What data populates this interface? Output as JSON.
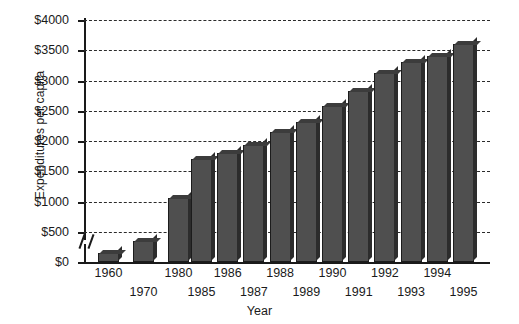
{
  "chart_data": {
    "type": "bar",
    "title": "",
    "xlabel": "Year",
    "ylabel": "Expenditures per capita",
    "ylim": [
      0,
      4000
    ],
    "ytick_step": 500,
    "ytick_labels": [
      "$0",
      "$500",
      "$1000",
      "$1500",
      "$2000",
      "$2500",
      "$3000",
      "$3500",
      "$4000"
    ],
    "ytick_values": [
      0,
      500,
      1000,
      1500,
      2000,
      2500,
      3000,
      3500,
      4000
    ],
    "grid": true,
    "legend": "none",
    "axis_break": true,
    "axis_break_between": [
      "1980",
      "1985"
    ],
    "categories": [
      "1960",
      "1970",
      "1980",
      "1985",
      "1986",
      "1987",
      "1988",
      "1989",
      "1990",
      "1991",
      "1992",
      "1993",
      "1994",
      "1995"
    ],
    "values": [
      150,
      350,
      1050,
      1700,
      1800,
      1930,
      2150,
      2320,
      2580,
      2830,
      3130,
      3300,
      3410,
      3600
    ],
    "label_rows": [
      0,
      1,
      0,
      1,
      0,
      1,
      0,
      1,
      0,
      1,
      0,
      1,
      0,
      1
    ],
    "bar_color": "#4f4f4f",
    "bar_side_color": "#2c2c2c",
    "axis_color": "#1a1a1a",
    "grid_color": "#2b2b2b",
    "background": "#ffffff"
  }
}
